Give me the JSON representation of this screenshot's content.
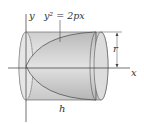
{
  "diagram": {
    "equation": "y² = 2px",
    "labels": {
      "y_axis": "y",
      "x_axis": "x",
      "radius": "r",
      "height": "h"
    },
    "colors": {
      "cylinder_fill": "#d8d8d8",
      "paraboloid_fill": "#c4c4c4",
      "lines": "#444444"
    }
  }
}
